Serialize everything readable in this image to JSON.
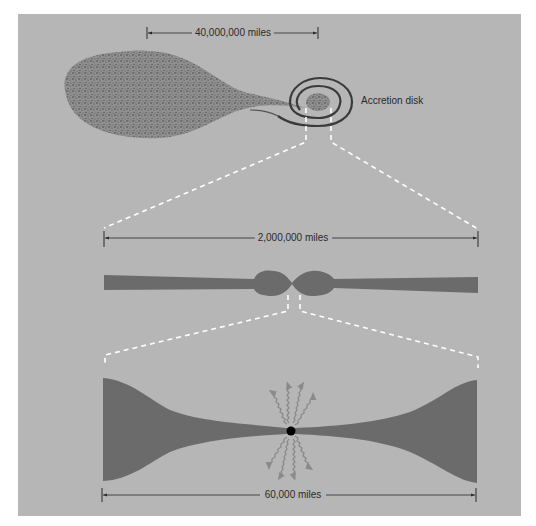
{
  "figure": {
    "background_color": "#b6b6b6",
    "disk_color": "#6b6b6b",
    "dash_color": "#ffffff",
    "ink_color": "#2a2a2a",
    "black_hole_color": "#000000",
    "radiation_color": "#8a8a8a"
  },
  "panels": {
    "binary_system": {
      "scale_label": "40,000,000 miles",
      "accretion_label": "Accretion disk",
      "components": [
        "companion-star-teardrop",
        "accretion-disk-spiral"
      ]
    },
    "disk_side_view": {
      "scale_label": "2,000,000 miles",
      "components": [
        "edge-on-disk",
        "central-bulge"
      ]
    },
    "inner_region": {
      "scale_label": "60,000 miles",
      "components": [
        "flared-inner-disk",
        "black-hole",
        "radiation-arrows"
      ],
      "radiation_arrow_count": 8
    }
  }
}
